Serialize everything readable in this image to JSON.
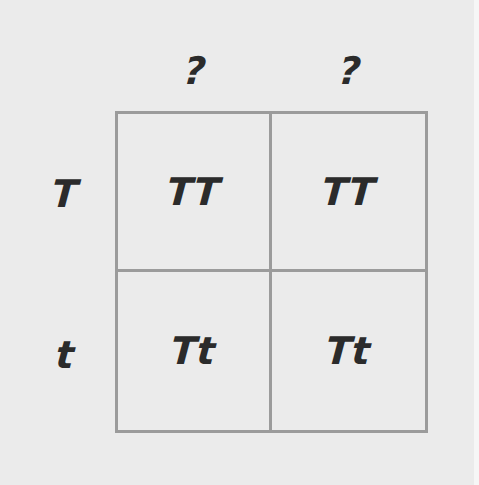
{
  "punnett_square": {
    "column_headers": [
      "?",
      "?"
    ],
    "row_headers": [
      "T",
      "t"
    ],
    "cells": [
      [
        "TT",
        "TT"
      ],
      [
        "Tt",
        "Tt"
      ]
    ]
  },
  "colors": {
    "background": "#ebebeb",
    "grid_lines": "#9b9b9b",
    "text": "#2b2b2b"
  }
}
